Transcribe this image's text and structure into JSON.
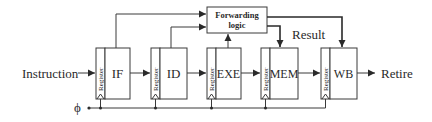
{
  "diagram": {
    "input_label": "Instruction",
    "output_label": "Retire",
    "clock_label": "ϕ",
    "result_label": "Result",
    "forwarding": {
      "line1": "Forwarding",
      "line2": "logic"
    },
    "register_label": "Register",
    "stages": [
      {
        "id": "if",
        "label": "IF"
      },
      {
        "id": "id",
        "label": "ID"
      },
      {
        "id": "exe",
        "label": "EXE"
      },
      {
        "id": "mem",
        "label": "MEM"
      },
      {
        "id": "wb",
        "label": "WB"
      }
    ],
    "colors": {
      "line": "#3a3a3a",
      "text": "#2a2a2a",
      "background": "#ffffff"
    }
  }
}
